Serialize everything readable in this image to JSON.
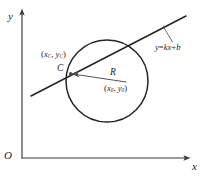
{
  "figure": {
    "name": "circle-line-intersection-diagram",
    "background_color": "#ffffff",
    "ink_color": "#262626"
  },
  "axes": {
    "y_label": "y",
    "x_label": "x",
    "origin_label": "O",
    "color": "#3a3a3a",
    "y_axis": {
      "x": 22,
      "top": 10,
      "bottom": 158
    },
    "x_axis": {
      "y": 158,
      "left": 22,
      "right": 190
    }
  },
  "circle": {
    "center_x": 107,
    "center_y": 81,
    "radius": 41,
    "center_label": {
      "open": "(",
      "x_var": "x",
      "x_sub": "0",
      "comma": ", ",
      "y_var": "y",
      "y_sub": "0",
      "close": ")"
    },
    "color": "#262626"
  },
  "radius_arrow": {
    "label": "R",
    "from_x": 124,
    "from_y": 81,
    "to_x": 72,
    "to_y": 74,
    "color": "#4a4a4a"
  },
  "line": {
    "equation_label": {
      "lhs": "y",
      "op": "=",
      "slope": "k",
      "x_var": "x",
      "plus": "+",
      "intercept": "b"
    },
    "equation_text": "y=kx+b",
    "x1": 31,
    "y1": 96,
    "x2": 186,
    "y2": 16,
    "color": "#262626",
    "leader": {
      "x1": 163,
      "y1": 26,
      "x2": 172,
      "y2": 42
    }
  },
  "intersection_point": {
    "marker_label": "C",
    "coords_label": {
      "open": "(",
      "x_var": "x",
      "x_sub": "C",
      "comma": ", ",
      "y_var": "y",
      "y_sub": "C",
      "close": ")"
    },
    "x": 71,
    "y": 74
  }
}
